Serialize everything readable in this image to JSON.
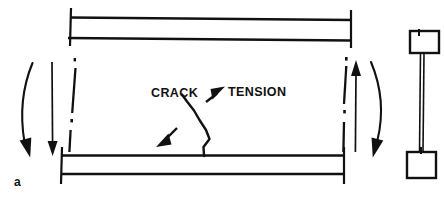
{
  "figure": {
    "label": "a",
    "type": "engineering-diagram",
    "background_color": "#ffffff",
    "ink_color": "#111111"
  },
  "annotations": {
    "crack_label": "CRACK",
    "tension_label": "TENSION"
  },
  "elevation": {
    "top_flange": {
      "left_x": 68,
      "right_x": 352,
      "line1_y": 17,
      "line2_y": 38,
      "endcap_top_y": 8,
      "endcap_bottom_y": 46
    },
    "bottom_flange": {
      "left_x": 60,
      "right_x": 345,
      "line1_y": 155,
      "line2_y": 174,
      "endcap_top_y": 147,
      "endcap_bottom_y": 183
    },
    "section_line_left_x": 74,
    "section_line_right_x": 345,
    "section_line_top_y": 58,
    "section_line_bottom_y": 156
  },
  "load_arrows": {
    "left_straight": {
      "direction": "down",
      "x": 52,
      "top_y": 62,
      "bottom_y": 155
    },
    "right_straight": {
      "direction": "up",
      "x": 356,
      "top_y": 60,
      "bottom_y": 152
    },
    "left_curved": {
      "direction": "down",
      "bow": "left"
    },
    "right_curved": {
      "direction": "down",
      "bow": "right"
    }
  },
  "crack": {
    "description": "jagged vertical crack rising from bottom flange",
    "points": "204,156 202,146 209,138 206,128 199,118 193,108 186,99 181,93",
    "pointer_arrow": {
      "direction": "down-left",
      "from_x": 177,
      "from_y": 127,
      "to_x": 157,
      "to_y": 147
    }
  },
  "tension": {
    "arrow_direction": "up-right",
    "from_x": 206,
    "from_y": 103,
    "to_x": 224,
    "to_y": 88
  },
  "cross_section": {
    "top_flange_box": {
      "x": 409,
      "y": 30,
      "width": 30,
      "height": 23
    },
    "bottom_flange_box": {
      "x": 406,
      "y": 151,
      "width": 30,
      "height": 27
    },
    "web": {
      "x": 421,
      "top_y": 53,
      "bottom_y": 151,
      "width": 4
    }
  }
}
